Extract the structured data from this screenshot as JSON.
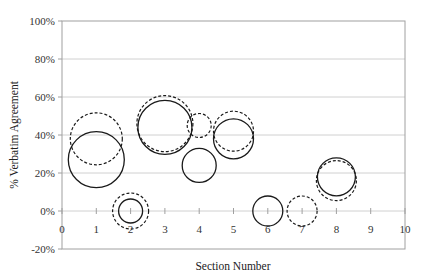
{
  "chart_data": {
    "type": "bubble",
    "title": "",
    "xlabel": "Section Number",
    "ylabel": "% Verbatim Agreement",
    "xlim": [
      0,
      10
    ],
    "ylim": [
      -20,
      100
    ],
    "x_ticks": [
      "0",
      "1",
      "2",
      "3",
      "4",
      "5",
      "6",
      "7",
      "8",
      "9",
      "10"
    ],
    "y_ticks": [
      "-20%",
      "0%",
      "20%",
      "40%",
      "60%",
      "80%",
      "100%"
    ],
    "y_tick_values": [
      -20,
      0,
      20,
      40,
      60,
      80,
      100
    ],
    "grid": {
      "horizontal": true,
      "vertical": false
    },
    "legend": null,
    "series": [
      {
        "name": "solid",
        "line_style": "solid",
        "points": [
          {
            "x": 1,
            "y": 27,
            "size": 28
          },
          {
            "x": 2,
            "y": 0,
            "size": 12
          },
          {
            "x": 3,
            "y": 44,
            "size": 27
          },
          {
            "x": 4,
            "y": 24,
            "size": 17
          },
          {
            "x": 5,
            "y": 38,
            "size": 20
          },
          {
            "x": 6,
            "y": 0,
            "size": 15
          },
          {
            "x": 8,
            "y": 18,
            "size": 19
          }
        ]
      },
      {
        "name": "dashed",
        "line_style": "dashed",
        "points": [
          {
            "x": 1,
            "y": 38,
            "size": 26
          },
          {
            "x": 2,
            "y": 0,
            "size": 18
          },
          {
            "x": 3,
            "y": 46,
            "size": 28
          },
          {
            "x": 4,
            "y": 45,
            "size": 12
          },
          {
            "x": 5,
            "y": 42,
            "size": 20
          },
          {
            "x": 7,
            "y": 0,
            "size": 15
          },
          {
            "x": 8,
            "y": 16,
            "size": 20
          }
        ]
      }
    ]
  },
  "colors": {
    "plot_border": "#a0a0a0",
    "gridline": "#d0d0d0",
    "bubble_stroke": "#1a1a1a"
  }
}
